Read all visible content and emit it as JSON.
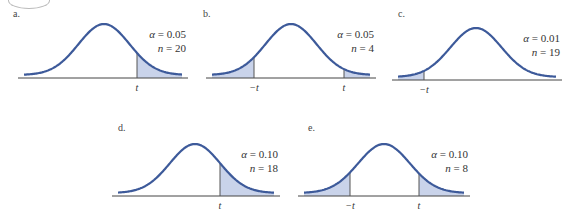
{
  "colors": {
    "curve": "#3d5a9a",
    "shade": "#c9d3ea",
    "axis": "#444444"
  },
  "panels": [
    {
      "label": "a.",
      "alpha": "0.05",
      "n": "20",
      "tails": "right",
      "ticks": [
        "t"
      ]
    },
    {
      "label": "b.",
      "alpha": "0.05",
      "n": "4",
      "tails": "two",
      "ticks": [
        "−t",
        "t"
      ]
    },
    {
      "label": "c.",
      "alpha": "0.01",
      "n": "19",
      "tails": "left",
      "ticks": [
        "−t"
      ]
    },
    {
      "label": "d.",
      "alpha": "0.10",
      "n": "18",
      "tails": "right",
      "ticks": [
        "t"
      ]
    },
    {
      "label": "e.",
      "alpha": "0.10",
      "n": "8",
      "tails": "two",
      "ticks": [
        "−t",
        "t"
      ]
    }
  ],
  "symbols": {
    "alpha": "α = ",
    "n": "n = "
  }
}
